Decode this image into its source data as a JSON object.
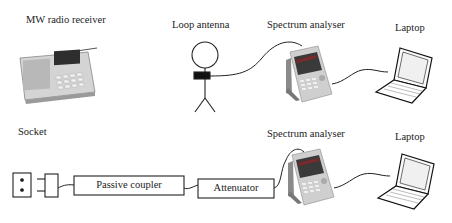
{
  "diagram": {
    "top_row": {
      "radio_label": "MW radio receiver",
      "antenna_label": "Loop antenna",
      "analyser_label": "Spectrum analyser",
      "laptop_label": "Laptop"
    },
    "bottom_row": {
      "socket_label": "Socket",
      "coupler_label": "Passive coupler",
      "attenuator_label": "Attenuator",
      "analyser_label": "Spectrum analyser",
      "laptop_label": "Laptop"
    },
    "colors": {
      "line": "#222222",
      "device_body": "#c8c8c8",
      "screen_dark": "#3a3a3a",
      "screen_accent": "#7a2a2a"
    }
  }
}
